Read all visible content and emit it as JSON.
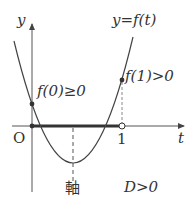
{
  "figure": {
    "axis_labels": {
      "y": "y",
      "x": "t",
      "origin": "O",
      "tick_one": "1"
    },
    "curve_label": "y=f(t)",
    "annotations": {
      "f0": "f(0)≥0",
      "f1": "f(1)>0",
      "axis_of_symmetry": "軸",
      "discriminant": "D>0"
    },
    "colors": {
      "line": "#444444",
      "curve": "#555555",
      "dashed": "#666666",
      "background": "#ffffff"
    }
  }
}
